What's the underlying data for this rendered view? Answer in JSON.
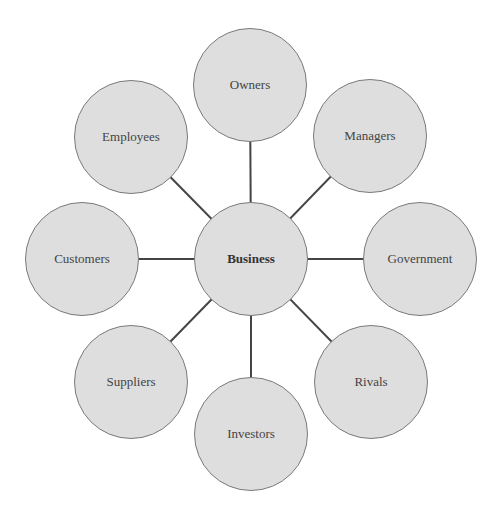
{
  "diagram": {
    "center": {
      "label": "Business",
      "x": 251,
      "y": 259
    },
    "nodes": [
      {
        "label": "Owners",
        "x": 250,
        "y": 85
      },
      {
        "label": "Managers",
        "x": 370,
        "y": 136
      },
      {
        "label": "Government",
        "x": 420,
        "y": 259
      },
      {
        "label": "Rivals",
        "x": 371,
        "y": 382
      },
      {
        "label": "Investors",
        "x": 251,
        "y": 434
      },
      {
        "label": "Suppliers",
        "x": 131,
        "y": 382
      },
      {
        "label": "Customers",
        "x": 82,
        "y": 259
      },
      {
        "label": "Employees",
        "x": 131,
        "y": 137
      }
    ],
    "colors": {
      "fill": "#dedede",
      "stroke": "#7a7a7a",
      "line": "#444444"
    }
  }
}
